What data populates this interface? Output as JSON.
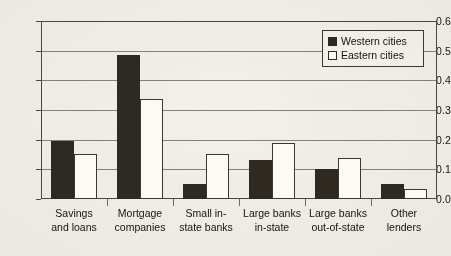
{
  "chart_data": {
    "type": "bar",
    "title": "",
    "xlabel": "",
    "ylabel": "",
    "ylim": [
      0.0,
      0.6
    ],
    "yticks": [
      "0.0",
      "0.1",
      "0.2",
      "0.3",
      "0.4",
      "0.5",
      "0.6"
    ],
    "grid": true,
    "legend_position": "top-right",
    "categories": [
      "Savings and loans",
      "Mortgage companies",
      "Small in-state banks",
      "Large banks in-state",
      "Large banks out-of-state",
      "Other lenders"
    ],
    "category_lines": [
      [
        "Savings",
        "and loans"
      ],
      [
        "Mortgage",
        "companies"
      ],
      [
        "Small in-",
        "state banks"
      ],
      [
        "Large banks",
        "in-state"
      ],
      [
        "Large banks",
        "out-of-state"
      ],
      [
        "Other",
        "lenders"
      ]
    ],
    "series": [
      {
        "name": "Western cities",
        "color": "#2e2a21",
        "values": [
          0.195,
          0.487,
          0.05,
          0.131,
          0.101,
          0.049
        ]
      },
      {
        "name": "Eastern cities",
        "color": "#fbfaf5",
        "values": [
          0.151,
          0.338,
          0.152,
          0.19,
          0.139,
          0.035
        ]
      }
    ]
  },
  "legend": {
    "items": [
      {
        "label": "Western cities",
        "swatch": "filled-black-square"
      },
      {
        "label": "Eastern cities",
        "swatch": "outlined-white-square"
      }
    ]
  }
}
